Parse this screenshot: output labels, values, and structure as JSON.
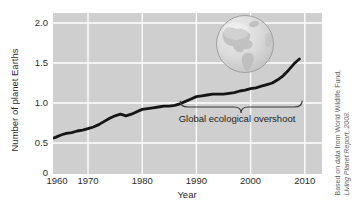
{
  "figure": {
    "y_axis_title": "Number of planet Earths",
    "x_axis_title": "Year",
    "credit": {
      "line1": "Based on data from World Wildlife Fund,",
      "line2": "Living Planet Report, 2008."
    }
  },
  "chart_data": {
    "type": "line",
    "title": "",
    "xlabel": "Year",
    "ylabel": "Number of planet Earths",
    "xlim": [
      1960,
      2013
    ],
    "ylim": [
      0,
      2.1
    ],
    "grid": true,
    "legend": "none",
    "plot_background": "#cfcfcf",
    "gridline_color": "#ffffff",
    "line_color": "#151515",
    "text_color": "#2b2b2b",
    "xticks": [
      {
        "label": "1960",
        "value": 1960
      },
      {
        "label": "1970",
        "value": 1970
      },
      {
        "label": "1980",
        "value": 1980
      },
      {
        "label": "1990",
        "value": 1990
      },
      {
        "label": "2000",
        "value": 2000
      },
      {
        "label": "2010",
        "value": 2010
      }
    ],
    "yticks": [
      {
        "label": "0",
        "value": 0
      },
      {
        "label": "0.5",
        "value": 0.5
      },
      {
        "label": "1.0",
        "value": 1.0
      },
      {
        "label": "1.5",
        "value": 1.5
      },
      {
        "label": "2.0",
        "value": 2.0
      }
    ],
    "series": [
      {
        "name": "Global ecological footprint (number of planet Earths)",
        "x": [
          1961,
          1962,
          1963,
          1964,
          1965,
          1966,
          1967,
          1968,
          1969,
          1970,
          1971,
          1972,
          1973,
          1974,
          1975,
          1976,
          1977,
          1978,
          1979,
          1980,
          1981,
          1982,
          1983,
          1984,
          1985,
          1986,
          1987,
          1988,
          1989,
          1990,
          1991,
          1992,
          1993,
          1994,
          1995,
          1996,
          1997,
          1998,
          1999,
          2000,
          2001,
          2002,
          2003,
          2004,
          2005,
          2006,
          2007,
          2008,
          2009
        ],
        "y": [
          0.52,
          0.53,
          0.55,
          0.57,
          0.6,
          0.62,
          0.63,
          0.65,
          0.66,
          0.68,
          0.7,
          0.73,
          0.77,
          0.81,
          0.84,
          0.86,
          0.84,
          0.86,
          0.89,
          0.92,
          0.93,
          0.94,
          0.95,
          0.96,
          0.96,
          0.97,
          0.99,
          1.02,
          1.05,
          1.08,
          1.09,
          1.1,
          1.11,
          1.11,
          1.11,
          1.12,
          1.13,
          1.15,
          1.16,
          1.18,
          1.19,
          1.21,
          1.23,
          1.25,
          1.29,
          1.34,
          1.41,
          1.49,
          1.55
        ]
      }
    ],
    "annotations": [
      {
        "style": "underbrace",
        "text": "Global ecological overshoot",
        "x_start": 1987,
        "x_end": 2009.5
      }
    ],
    "icon": "globe-icon"
  }
}
